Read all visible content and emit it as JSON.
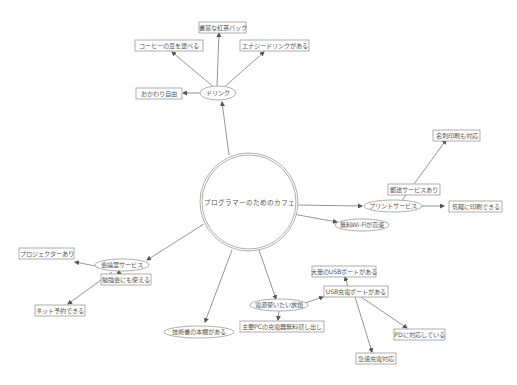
{
  "diagram": {
    "type": "mind-map",
    "center": {
      "label": "プログラマーのためのカフェ"
    },
    "branches": {
      "drink": {
        "label": "ドリンク",
        "children": [
          "書富な紅茶パック",
          "コーヒーの豆を選べる",
          "エナジードリンクがある",
          "おかわり自由"
        ]
      },
      "print": {
        "label": "プリントサービス",
        "children": [
          "名刺印刷も対応",
          "郵送サービスあり",
          "気軽に印刷できる"
        ]
      },
      "wifi": {
        "label": "無料Wi-Fiが高速"
      },
      "meeting": {
        "label": "会議室サービス",
        "children": [
          "プロジェクターあり",
          "勉強会にも使える",
          "ネット予約できる"
        ]
      },
      "books": {
        "label": "技術書の本棚がある"
      },
      "power": {
        "label": "電源使いたい放題",
        "children": [
          "主要PCの充電器無料貸し出し",
          "USB充電ポートがある"
        ]
      },
      "usb": {
        "label": "USB充電ポートがある",
        "children": [
          "大量のUSBポートがある",
          "PDに対応している",
          "急速充電対応"
        ]
      }
    },
    "colors": {
      "line": "#7a7a7a",
      "border": "#9a9a9a",
      "text": "#555555",
      "background": "#ffffff"
    }
  }
}
